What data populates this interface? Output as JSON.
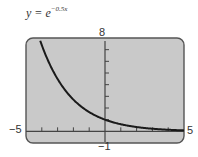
{
  "title": {
    "prefix": "y = e",
    "exponent": "−0.5x"
  },
  "labels": {
    "ymax": "8",
    "ymin": "−1",
    "xmin": "−5",
    "xmax": "5"
  },
  "colors": {
    "screen": "#c9c9c9",
    "border": "#555555",
    "curve": "#1a1a1a",
    "axis": "#444444"
  },
  "chart_data": {
    "type": "line",
    "xlabel": "",
    "ylabel": "",
    "xlim": [
      -5,
      5
    ],
    "ylim": [
      -1,
      8
    ],
    "xticks_step": 1,
    "yticks_step": 1,
    "grid": false,
    "series": [
      {
        "name": "y = e^(-0.5x)",
        "x": [
          -4.1,
          -4,
          -3.5,
          -3,
          -2.5,
          -2,
          -1.5,
          -1,
          -0.5,
          0,
          0.5,
          1,
          1.5,
          2,
          2.5,
          3,
          3.5,
          4,
          4.5,
          5
        ],
        "y": [
          7.77,
          7.39,
          5.75,
          4.48,
          3.49,
          2.72,
          2.12,
          1.65,
          1.28,
          1.0,
          0.78,
          0.61,
          0.47,
          0.37,
          0.29,
          0.22,
          0.17,
          0.14,
          0.11,
          0.08
        ]
      }
    ]
  }
}
